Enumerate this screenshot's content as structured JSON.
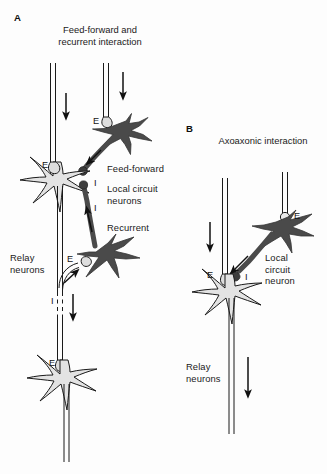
{
  "figure": {
    "background_color": "#fdfdfd",
    "soma_fill": "#e3e3e3",
    "interneuron_fill": "#4a4a4a",
    "stroke_color": "#1a1a1a"
  },
  "panel_a": {
    "letter": "A",
    "title": "Feed-forward and\nrecurrent interaction",
    "labels": {
      "feed_forward": "Feed-forward",
      "local_circuit_neurons": "Local circuit\nneurons",
      "recurrent": "Recurrent",
      "relay_neurons": "Relay\nneurons"
    },
    "terminals": {
      "e_top": "E",
      "e_soma": "E",
      "i_feedforward": "I",
      "i_recurrent": "I",
      "e_recurrent": "E",
      "i_axon": "I",
      "e_bottom": "E"
    }
  },
  "panel_b": {
    "letter": "B",
    "title": "Axoaxonic interaction",
    "labels": {
      "local_circuit_neuron": "Local\ncircuit\nneuron",
      "relay_neurons": "Relay\nneurons"
    },
    "terminals": {
      "e_interneuron": "E",
      "e_soma": "E",
      "i_axoaxonic": "I"
    }
  }
}
